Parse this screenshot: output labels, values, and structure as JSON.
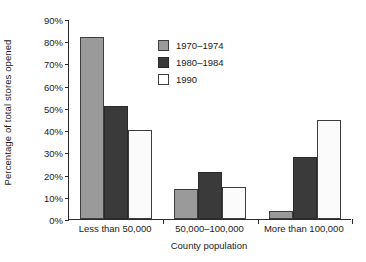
{
  "chart_data": {
    "type": "bar",
    "title": "",
    "xlabel": "County population",
    "ylabel": "Percentage of total stores opened",
    "categories": [
      "Less than 50,000",
      "50,000–100,000",
      "More than 100,000"
    ],
    "series": [
      {
        "name": "1970–1974",
        "color": "#9a9a9a",
        "values": [
          82,
          13.5,
          3.5
        ]
      },
      {
        "name": "1980–1984",
        "color": "#3a3a3a",
        "values": [
          51,
          21,
          28
        ]
      },
      {
        "name": "1990",
        "color": "#ffffff",
        "values": [
          40,
          14.5,
          44.5
        ]
      }
    ],
    "ylim": [
      0,
      90
    ],
    "ytick_labels": [
      "90%",
      "80%",
      "70%",
      "60%",
      "50%",
      "40%",
      "30%",
      "20%",
      "10%",
      "0%"
    ],
    "ytick_values": [
      90,
      80,
      70,
      60,
      50,
      40,
      30,
      20,
      10,
      0
    ],
    "grid": false,
    "legend_position": "upper-center"
  },
  "legend": {
    "entries": [
      {
        "label": "1970–1974"
      },
      {
        "label": "1980–1984"
      },
      {
        "label": "1990"
      }
    ]
  },
  "axes": {
    "y_title": "Percentage of total stores opened",
    "x_title": "County population"
  }
}
